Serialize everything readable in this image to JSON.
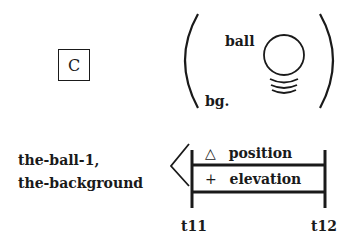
{
  "symbol_box": {
    "label": "C"
  },
  "scene": {
    "object_label": "ball",
    "background_label": "bg."
  },
  "objects_list": {
    "line1": "the-ball-1,",
    "line2": "the-background"
  },
  "timeline": {
    "rows": [
      {
        "icon": "triangle-icon",
        "glyph": "△",
        "label": "position"
      },
      {
        "icon": "plus-icon",
        "glyph": "+",
        "label": "elevation"
      }
    ],
    "start_label": "t11",
    "end_label": "t12"
  }
}
